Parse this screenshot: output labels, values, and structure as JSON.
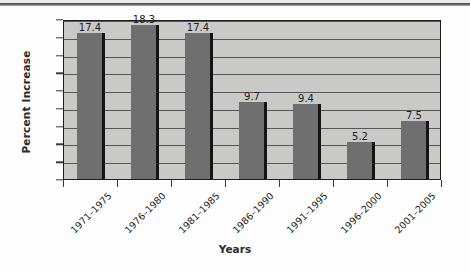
{
  "chart_data": {
    "type": "bar",
    "title": "",
    "xlabel": "Years",
    "ylabel": "Percent Increase",
    "categories": [
      "1971–1975",
      "1976–1980",
      "1981–1985",
      "1986–1990",
      "1991–1995",
      "1996–2000",
      "2001–2005"
    ],
    "values": [
      17.4,
      18.3,
      17.4,
      9.7,
      9.4,
      5.2,
      7.5
    ],
    "value_labels": [
      "17.4",
      "18.3",
      "17.4",
      "9.7",
      "9.4",
      "5.2",
      "7.5"
    ],
    "ylim": [
      1,
      19
    ],
    "ytick_labels": [
      "1",
      "3",
      "5",
      "7",
      "9",
      "11",
      "13",
      "15",
      "17",
      "19"
    ],
    "ytick_values": [
      1,
      3,
      5,
      7,
      9,
      11,
      13,
      15,
      17,
      19
    ],
    "grid": "horizontal",
    "legend": "none",
    "series": [
      {
        "name": "Percent Increase",
        "values": [
          17.4,
          18.3,
          17.4,
          9.7,
          9.4,
          5.2,
          7.5
        ]
      }
    ],
    "colors": {
      "bar_fill": "#6f6f6f",
      "bar_edge": "#141414",
      "plot_background": "#c9c9c7",
      "gridline": "#56565a",
      "axis": "#1d1d1d",
      "text": "#1c1c1c",
      "page_background": "#fdfdfd"
    }
  }
}
